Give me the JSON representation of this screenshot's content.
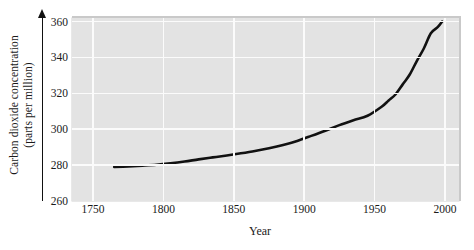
{
  "chart_data": {
    "type": "line",
    "title": "",
    "xlabel": "Year",
    "ylabel_line1": "Carbon dioxide concentration",
    "ylabel_line2": "(parts per million)",
    "xlim": [
      1735,
      2010
    ],
    "ylim": [
      260,
      362
    ],
    "xticks": [
      1750,
      1800,
      1850,
      1900,
      1950,
      2000
    ],
    "xtick_labels": [
      "1750",
      "1800",
      "1850",
      "1900",
      "1950",
      "2000"
    ],
    "yticks": [
      260,
      280,
      300,
      320,
      340,
      360
    ],
    "ytick_labels": [
      "260",
      "280",
      "300",
      "320",
      "340",
      "360"
    ],
    "grid": "both",
    "legend": "none",
    "line_color": "#111111",
    "plot_background": "#e3e3e3",
    "gridline_color": "#fbfbfb",
    "series": [
      {
        "name": "Atmospheric CO2",
        "x": [
          1765,
          1775,
          1785,
          1795,
          1805,
          1815,
          1825,
          1835,
          1845,
          1855,
          1865,
          1875,
          1885,
          1895,
          1905,
          1915,
          1925,
          1935,
          1945,
          1955,
          1960,
          1965,
          1970,
          1975,
          1980,
          1985,
          1990,
          1995,
          1998
        ],
        "y": [
          279,
          279.3,
          279.7,
          280.2,
          281.0,
          282.0,
          283.2,
          284.3,
          285.4,
          286.6,
          287.9,
          289.4,
          291.2,
          293.5,
          296.3,
          299.2,
          302.3,
          305.0,
          307.5,
          312.5,
          316.0,
          319.5,
          325.0,
          330.5,
          338.0,
          345.0,
          353.5,
          357.0,
          360.0
        ]
      }
    ]
  }
}
